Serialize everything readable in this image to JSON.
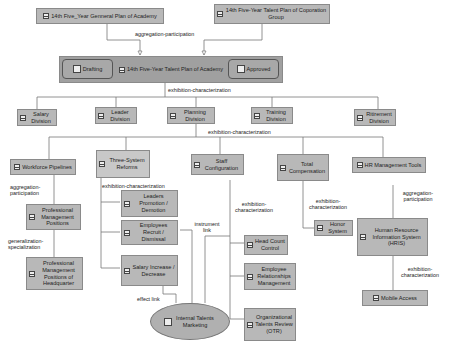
{
  "nodes": {
    "general_plan": "14th Five_Year Genneral Plan of Academy",
    "corp_plan": "14th Five-Year Talent Plan of Coporation Group",
    "main_plan": "14th Five-Year Talent Plan of Academy",
    "drafting": "Drafting",
    "approved": "Approved",
    "salary_div": "Salary Division",
    "leader_div": "Leader Division",
    "planning_div": "Planning Division",
    "training_div": "Training Division",
    "retirement_div": "Ritirement Division",
    "workforce": "Workforce Pipelines",
    "three_system": "Three-System Reforms",
    "staff_config": "Staff Configuration",
    "total_comp": "Total Compensation",
    "hr_tools": "HR Management Tools",
    "prof_mgmt": "Professional Management Positions",
    "prof_mgmt_hq": "Professional Management Positions of Headquarter",
    "leaders_promo": "Leaders Promotion / Demotion",
    "emp_recruit": "Employees Recruit / Dismissal",
    "salary_inc": "Salary Increase / Decrease",
    "internal_mkt": "Internal Talents Marketing",
    "head_count": "Head Count Control",
    "emp_rel": "Employee Relationships Management",
    "otr": "Organizational Talents Review (OTR)",
    "honor": "Honor System",
    "hris": "Human Resource Information System (HRIS)",
    "mobile": "Mobile Access"
  },
  "links": {
    "agg_top": "aggregation-participation",
    "exh_main": "exhibition-characterization",
    "exh_planning": "exhibition-characterization",
    "agg_workforce": "aggregation-participation",
    "gen_spec": "generalization-specialization",
    "exh_three": "exhibition-characterization",
    "instrument": "instrument link",
    "effect": "effect link",
    "exh_staff": "exhibition-characterization",
    "exh_comp": "exhibition-characterization",
    "agg_hr": "aggregation-participation",
    "exh_hris": "exhibition-characterization"
  }
}
